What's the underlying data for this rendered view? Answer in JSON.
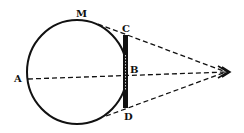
{
  "diagram": {
    "labels": {
      "A": "A",
      "M": "M",
      "C": "C",
      "B": "B",
      "D": "D"
    },
    "eye_symbol": "eye-icon",
    "colors": {
      "ink": "#111111",
      "background": "#ffffff"
    }
  }
}
